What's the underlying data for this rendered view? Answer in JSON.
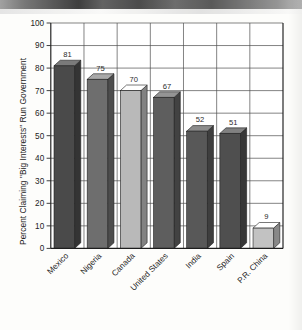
{
  "chart_data": {
    "type": "bar",
    "title": "",
    "subtitle": "",
    "xlabel": "",
    "ylabel": "Percent Claiming \"Big Interests\" Run Government",
    "categories": [
      "Mexico",
      "Nigeria",
      "Canada",
      "United States",
      "India",
      "Spain",
      "P.R. China"
    ],
    "values": [
      81,
      75,
      70,
      67,
      52,
      51,
      9
    ],
    "value_labels": [
      "81",
      "75",
      "70",
      "67",
      "52",
      "51",
      "9"
    ],
    "ylim": [
      0,
      100
    ],
    "ytick_step": 10,
    "ytick_labels": [
      "0",
      "10",
      "20",
      "30",
      "40",
      "50",
      "60",
      "70",
      "80",
      "90",
      "100"
    ],
    "grid": "horizontal-and-vertical",
    "legend": "none",
    "bar_style": "3d-isometric",
    "xtick_rotation_degrees": 45,
    "bar_colors": {
      "Mexico": "#4a4a4a",
      "Nigeria": "#6e6e6e",
      "Canada": "#b9b9b9",
      "United States": "#5e5e5e",
      "India": "#585858",
      "Spain": "#4f4f4f",
      "P.R. China": "#c2c2c2"
    }
  },
  "colors": {
    "page_background": "#fdfdfb",
    "plot_background": "#ffffff",
    "grid": "#4f4f4f",
    "axis": "#1d1d1d",
    "text": "#232323",
    "scan_band": "#4a4a4a"
  },
  "artifacts": {
    "top_scan_band_label": "scan-artifact-band",
    "page_edge_label": "page-edge-shadow"
  }
}
